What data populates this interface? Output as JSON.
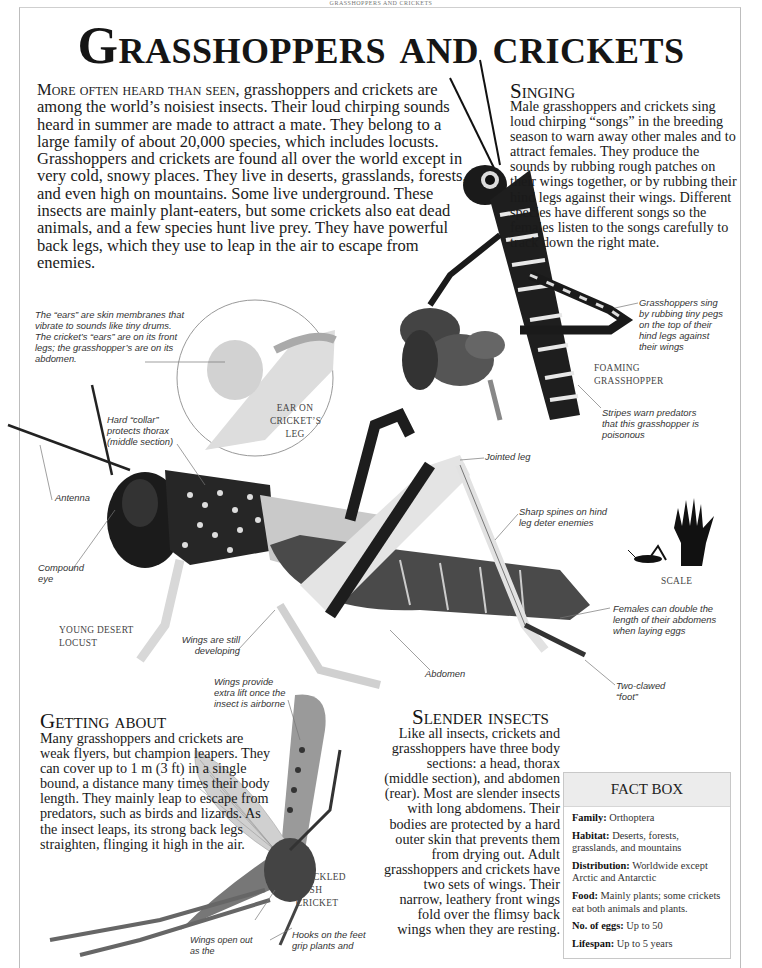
{
  "running_head": "GRASSHOPPERS AND CRICKETS",
  "title": "Grasshoppers and crickets",
  "intro": {
    "lead": "More often heard than seen,",
    "text": " grasshoppers and crickets are among the world’s noisiest insects. Their loud chirping sounds heard in summer are made to attract a mate. They belong to a large family of about 20,000 species, which includes locusts. Grasshoppers and crickets are found all over the world except in very cold, snowy places. They live in deserts, grasslands, forests, and even high on mountains. Some live underground. These insects are mainly plant-eaters, but some crickets also eat dead animals, and a few species hunt live prey. They have powerful back legs, which they use to leap in the air to escape from enemies."
  },
  "sections": {
    "singing": {
      "heading": "Singing",
      "body": "Male grasshoppers and crickets sing loud chirping “songs” in the breeding season to warn away other males and to attract females. They produce the sounds by rubbing rough patches on their wings together, or by rubbing their hind legs against their wings. Different species have different songs so the females listen to the songs carefully to track down the right mate."
    },
    "getting_about": {
      "heading": "Getting about",
      "body": "Many grasshoppers and crickets are weak flyers, but champion leapers. They can cover up to 1 m (3 ft) in a single bound, a distance many times their body length. They mainly leap to escape from predators, such as birds and lizards. As the insect leaps, its strong back legs straighten, flinging it high in the air."
    },
    "slender_insects": {
      "heading": "Slender insects",
      "body": "Like all insects, crickets and grasshoppers have three body sections: a head, thorax (middle section), and abdomen (rear). Most are slender insects with long abdomens. Their bodies are protected by a hard outer skin that prevents them from drying out. Adult grasshoppers and crickets have two sets of wings. Their narrow, leathery front wings fold over the flimsy back wings when they are resting."
    }
  },
  "captions": {
    "ears": "The “ears” are skin membranes that vibrate to sounds like tiny drums. The cricket’s “ears” are on its front legs; the grasshopper’s are on its abdomen.",
    "collar": "Hard “collar” protects thorax (middle section)",
    "antenna": "Antenna",
    "compound_eye": "Compound eye",
    "wings_developing": "Wings are still developing",
    "abdomen": "Abdomen",
    "jointed_leg": "Jointed leg",
    "spines": "Sharp spines on hind leg deter enemies",
    "females": "Females can double the length of their abdomens when laying eggs",
    "foot": "Two-clawed “foot”",
    "sing_pegs": "Grasshoppers sing by rubbing tiny pegs on the top of their hind legs against their wings",
    "stripes": "Stripes warn predators that this grasshopper is poisonous",
    "wings_lift": "Wings provide extra lift once the insect is airborne",
    "wings_open": "Wings open out as the",
    "hooks": "Hooks on the feet grip plants and"
  },
  "labels": {
    "ear_inset": "Ear on cricket’s leg",
    "young_locust": "Young desert locust",
    "foaming": "Foaming grasshopper",
    "bush_cricket": "Speckled bush cricket",
    "scale": "Scale"
  },
  "factbox": {
    "title": "FACT BOX",
    "rows": [
      {
        "key": "Family:",
        "value": "Orthoptera"
      },
      {
        "key": "Habitat:",
        "value": "Deserts, forests, grasslands, and mountains"
      },
      {
        "key": "Distribution:",
        "value": "Worldwide except Arctic and Antarctic"
      },
      {
        "key": "Food:",
        "value": "Mainly plants; some crickets eat both animals and plants."
      },
      {
        "key": "No. of eggs:",
        "value": "Up to 50"
      },
      {
        "key": "Lifespan:",
        "value": "Up to 5 years"
      }
    ]
  }
}
